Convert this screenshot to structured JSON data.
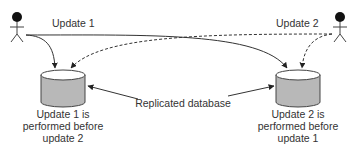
{
  "diagram": {
    "actors": [
      {
        "id": "user-left",
        "label": ""
      },
      {
        "id": "user-right",
        "label": ""
      }
    ],
    "updates": {
      "update1_label": "Update 1",
      "update2_label": "Update 2"
    },
    "databases": [
      {
        "id": "db-left",
        "caption_lines": [
          "Update 1 is",
          "performed before",
          "update 2"
        ]
      },
      {
        "id": "db-right",
        "caption_lines": [
          "Update 2 is",
          "performed before",
          "update 1"
        ]
      }
    ],
    "center_label": "Replicated database",
    "colors": {
      "line": "#333333",
      "cylinder_fill": "#b8b8b8",
      "cylinder_top": "#ffffff",
      "text": "#333333"
    }
  }
}
